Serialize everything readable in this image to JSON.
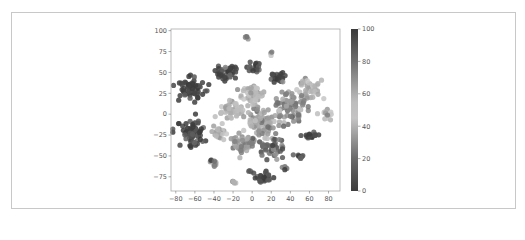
{
  "chart_data": {
    "type": "scatter",
    "title": "",
    "xlabel": "",
    "ylabel": "",
    "xlim": [
      -85,
      92
    ],
    "ylim": [
      -92,
      102
    ],
    "xticks": [
      -80,
      -60,
      -40,
      -20,
      0,
      20,
      40,
      60,
      80
    ],
    "yticks": [
      -75,
      -50,
      -25,
      0,
      25,
      50,
      75,
      100
    ],
    "grid": false,
    "legend": null,
    "colorbar": {
      "label": "",
      "min": 0,
      "max": 100,
      "ticks": [
        0,
        20,
        40,
        60,
        80,
        100
      ],
      "colormap": "grayscale-diverging (dark at 0 and 100, light near 50)"
    },
    "clusters": [
      {
        "cx": -63,
        "cy": 32,
        "rx": 14,
        "ry": 14,
        "value": 2,
        "n": 70
      },
      {
        "cx": -63,
        "cy": -22,
        "rx": 13,
        "ry": 16,
        "value": 3,
        "n": 70
      },
      {
        "cx": -27,
        "cy": 50,
        "rx": 10,
        "ry": 9,
        "value": 4,
        "n": 35
      },
      {
        "cx": 2,
        "cy": 55,
        "rx": 7,
        "ry": 7,
        "value": 6,
        "n": 20
      },
      {
        "cx": 26,
        "cy": 45,
        "rx": 8,
        "ry": 7,
        "value": 3,
        "n": 22
      },
      {
        "cx": -5,
        "cy": 90,
        "rx": 3,
        "ry": 3,
        "value": 20,
        "n": 5
      },
      {
        "cx": 20,
        "cy": 72,
        "rx": 2,
        "ry": 2,
        "value": 35,
        "n": 3
      },
      {
        "cx": 12,
        "cy": -77,
        "rx": 10,
        "ry": 7,
        "value": 4,
        "n": 28
      },
      {
        "cx": -40,
        "cy": -57,
        "rx": 5,
        "ry": 5,
        "value": 25,
        "n": 10
      },
      {
        "cx": -19,
        "cy": -80,
        "rx": 4,
        "ry": 3,
        "value": 45,
        "n": 6
      },
      {
        "cx": -2,
        "cy": -68,
        "rx": 3,
        "ry": 3,
        "value": 8,
        "n": 4
      },
      {
        "cx": 33,
        "cy": -65,
        "rx": 3,
        "ry": 3,
        "value": 12,
        "n": 4
      },
      {
        "cx": 62,
        "cy": -25,
        "rx": 7,
        "ry": 6,
        "value": 5,
        "n": 18
      },
      {
        "cx": 50,
        "cy": -50,
        "rx": 4,
        "ry": 4,
        "value": 8,
        "n": 8
      },
      {
        "cx": 78,
        "cy": 0,
        "rx": 6,
        "ry": 6,
        "value": 55,
        "n": 14
      },
      {
        "cx": 60,
        "cy": 30,
        "rx": 12,
        "ry": 14,
        "value": 55,
        "n": 40
      },
      {
        "cx": 40,
        "cy": 10,
        "rx": 18,
        "ry": 18,
        "value": 30,
        "n": 70
      },
      {
        "cx": 10,
        "cy": -10,
        "rx": 20,
        "ry": 22,
        "value": 35,
        "n": 90
      },
      {
        "cx": -20,
        "cy": 5,
        "rx": 14,
        "ry": 14,
        "value": 45,
        "n": 50
      },
      {
        "cx": -10,
        "cy": -35,
        "rx": 14,
        "ry": 12,
        "value": 30,
        "n": 50
      },
      {
        "cx": 20,
        "cy": -40,
        "rx": 14,
        "ry": 10,
        "value": 15,
        "n": 45
      },
      {
        "cx": -35,
        "cy": -20,
        "rx": 8,
        "ry": 10,
        "value": 50,
        "n": 25
      },
      {
        "cx": 0,
        "cy": 25,
        "rx": 14,
        "ry": 10,
        "value": 55,
        "n": 45
      }
    ]
  }
}
